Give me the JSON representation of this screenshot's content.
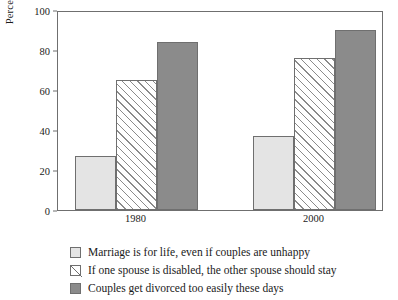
{
  "chart_data": {
    "type": "bar",
    "title": "",
    "xlabel": "",
    "ylabel": "Percentage agree",
    "categories": [
      "1980",
      "2000"
    ],
    "ylim": [
      0,
      100
    ],
    "yticks": [
      0,
      20,
      40,
      60,
      80,
      100
    ],
    "grid": false,
    "legend_position": "bottom-left",
    "series": [
      {
        "name": "Marriage is for life, even if couples are unhappy",
        "values": [
          27,
          37
        ],
        "style": "light-gray-fill",
        "color": "#e4e4e4"
      },
      {
        "name": "If one spouse is disabled, the other spouse should stay",
        "values": [
          65,
          76
        ],
        "style": "diagonal-hatch",
        "color": "#ffffff"
      },
      {
        "name": "Couples get divorced too easily these days",
        "values": [
          84,
          90
        ],
        "style": "dark-gray-fill",
        "color": "#8b8b8b"
      }
    ]
  },
  "axis": {
    "y_title": "Percentage agree",
    "y_tick_labels": [
      "100",
      "80",
      "60",
      "40",
      "20",
      "0"
    ],
    "x_tick_labels": [
      "1980",
      "2000"
    ]
  },
  "legend": {
    "items": [
      {
        "label": "Marriage is for life, even if couples are unhappy",
        "swatch": "light-gray-square"
      },
      {
        "label": "If one spouse is disabled, the other spouse should stay",
        "swatch": "hatched-square"
      },
      {
        "label": "Couples get divorced too easily these days",
        "swatch": "dark-gray-square"
      }
    ]
  },
  "colors": {
    "light": "#e4e4e4",
    "dark": "#8b8b8b",
    "outline": "#6f6f6f",
    "hatch": "#8b8b8b",
    "background": "#ffffff"
  }
}
